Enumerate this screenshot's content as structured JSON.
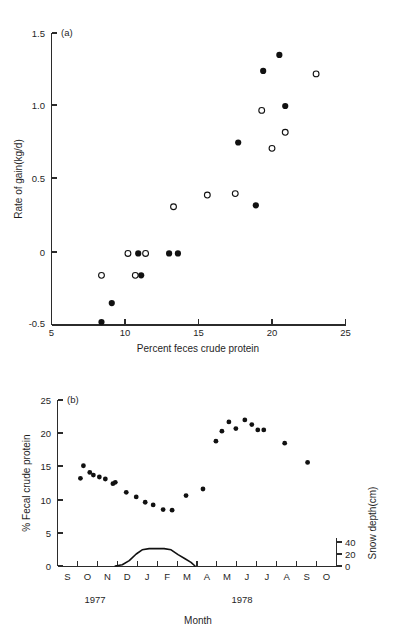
{
  "figure": {
    "background_color": "#ffffff",
    "ink_color": "#111111"
  },
  "panel_a": {
    "label": "(a)",
    "xlabel": "Percent feces crude protein",
    "ylabel": "Rate of gain(kg/d)",
    "xticks": [
      "5",
      "10",
      "15",
      "20",
      "25"
    ],
    "yticks": [
      "1.5",
      "1.0",
      "0.5",
      "0",
      "-0.5"
    ]
  },
  "panel_b": {
    "label": "(b)",
    "xlabel": "Month",
    "ylabel_left": "% Fecal crude protein",
    "ylabel_right": "Snow depth(cm)",
    "yticks_left": [
      "25",
      "20",
      "15",
      "10",
      "5",
      "0"
    ],
    "yticks_right": [
      "40",
      "20",
      "0"
    ],
    "months": [
      "S",
      "O",
      "N",
      "D",
      "J",
      "F",
      "M",
      "A",
      "M",
      "J",
      "J",
      "A",
      "S",
      "O"
    ],
    "years": [
      "1977",
      "1978"
    ]
  },
  "chart_data": [
    {
      "type": "scatter",
      "title": "(a)",
      "xlabel": "Percent feces crude protein",
      "ylabel": "Rate of gain(kg/d)",
      "xlim": [
        5,
        25
      ],
      "ylim": [
        -0.5,
        1.5
      ],
      "grid": false,
      "legend": "none",
      "series": [
        {
          "name": "filled-circles",
          "marker": "filled",
          "points": [
            {
              "x": 8.4,
              "y": -0.48
            },
            {
              "x": 9.1,
              "y": -0.35
            },
            {
              "x": 11.1,
              "y": -0.16
            },
            {
              "x": 10.9,
              "y": -0.01
            },
            {
              "x": 13.0,
              "y": -0.01
            },
            {
              "x": 13.6,
              "y": -0.01
            },
            {
              "x": 18.9,
              "y": 0.32
            },
            {
              "x": 17.7,
              "y": 0.75
            },
            {
              "x": 20.9,
              "y": 1.0
            },
            {
              "x": 19.4,
              "y": 1.24
            },
            {
              "x": 20.5,
              "y": 1.35
            }
          ]
        },
        {
          "name": "open-circles",
          "marker": "open",
          "points": [
            {
              "x": 8.4,
              "y": -0.16
            },
            {
              "x": 10.7,
              "y": -0.16
            },
            {
              "x": 10.2,
              "y": -0.01
            },
            {
              "x": 11.4,
              "y": -0.01
            },
            {
              "x": 13.3,
              "y": 0.31
            },
            {
              "x": 15.6,
              "y": 0.39
            },
            {
              "x": 17.5,
              "y": 0.4
            },
            {
              "x": 20.0,
              "y": 0.71
            },
            {
              "x": 20.9,
              "y": 0.82
            },
            {
              "x": 19.3,
              "y": 0.97
            },
            {
              "x": 23.0,
              "y": 1.22
            }
          ]
        }
      ]
    },
    {
      "type": "scatter",
      "title": "(b)",
      "xlabel": "Month",
      "ylabel": "% Fecal crude protein",
      "ylabel_secondary": "Snow depth(cm)",
      "x_categories": [
        "S",
        "O",
        "N",
        "D",
        "J",
        "F",
        "M",
        "A",
        "M",
        "J",
        "J",
        "A",
        "S",
        "O"
      ],
      "ylim": [
        0,
        25
      ],
      "ylim_secondary": [
        0,
        50
      ],
      "grid": false,
      "legend": "none",
      "series": [
        {
          "name": "fecal-crude-protein",
          "marker": "filled",
          "axis": "left",
          "points": [
            {
              "x": 1.15,
              "y": 13.2
            },
            {
              "x": 1.3,
              "y": 15.1
            },
            {
              "x": 1.62,
              "y": 14.1
            },
            {
              "x": 1.8,
              "y": 13.7
            },
            {
              "x": 2.1,
              "y": 13.4
            },
            {
              "x": 2.4,
              "y": 13.1
            },
            {
              "x": 2.78,
              "y": 12.4
            },
            {
              "x": 2.9,
              "y": 12.6
            },
            {
              "x": 3.45,
              "y": 11.1
            },
            {
              "x": 3.95,
              "y": 10.4
            },
            {
              "x": 4.4,
              "y": 9.6
            },
            {
              "x": 4.8,
              "y": 9.2
            },
            {
              "x": 5.3,
              "y": 8.5
            },
            {
              "x": 5.75,
              "y": 8.4
            },
            {
              "x": 6.45,
              "y": 10.6
            },
            {
              "x": 7.3,
              "y": 11.6
            },
            {
              "x": 7.95,
              "y": 18.8
            },
            {
              "x": 8.25,
              "y": 20.3
            },
            {
              "x": 8.6,
              "y": 21.7
            },
            {
              "x": 8.95,
              "y": 20.7
            },
            {
              "x": 9.4,
              "y": 22.0
            },
            {
              "x": 9.75,
              "y": 21.3
            },
            {
              "x": 10.05,
              "y": 20.5
            },
            {
              "x": 10.35,
              "y": 20.5
            },
            {
              "x": 11.4,
              "y": 18.5
            },
            {
              "x": 12.55,
              "y": 15.6
            }
          ]
        },
        {
          "name": "snow-depth-curve",
          "marker": "line",
          "axis": "right",
          "points": [
            {
              "x": 2.9,
              "y": 0
            },
            {
              "x": 3.25,
              "y": 2
            },
            {
              "x": 3.6,
              "y": 9
            },
            {
              "x": 3.95,
              "y": 20
            },
            {
              "x": 4.25,
              "y": 27
            },
            {
              "x": 4.6,
              "y": 29
            },
            {
              "x": 5.35,
              "y": 29
            },
            {
              "x": 5.7,
              "y": 27
            },
            {
              "x": 6.05,
              "y": 19
            },
            {
              "x": 6.4,
              "y": 12
            },
            {
              "x": 6.7,
              "y": 6
            },
            {
              "x": 6.9,
              "y": 0
            }
          ]
        }
      ]
    }
  ]
}
